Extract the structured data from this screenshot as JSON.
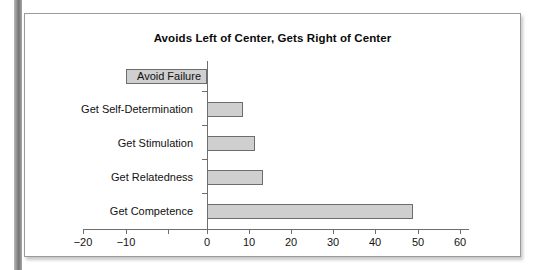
{
  "chart_data": {
    "type": "bar",
    "orientation": "horizontal",
    "title": "Avoids Left of Center, Gets Right of Center",
    "xlabel": "",
    "ylabel": "",
    "categories": [
      "Avoid Failure",
      "Get Self-Determination",
      "Get Stimulation",
      "Get Relatedness",
      "Get Competence"
    ],
    "values": [
      -20,
      9,
      12,
      14,
      51
    ],
    "xlim": [
      -20,
      60
    ],
    "xticks": [
      -20,
      -10,
      0,
      10,
      20,
      30,
      40,
      50,
      60
    ],
    "xtick_labels": [
      "−20",
      "−10",
      "0",
      "10",
      "20",
      "30",
      "40",
      "50",
      "60"
    ],
    "grid": false,
    "legend": false,
    "bar_fill_color": "#cfcfcf",
    "bar_border_color": "#6d6d6d",
    "axis_color": "#6f6f6f",
    "text_color": "#141414",
    "panel_background": "#ffffff",
    "panel_border_color": "#9a9a9a"
  },
  "page": {
    "gutter_color": "#8f8f8f"
  }
}
